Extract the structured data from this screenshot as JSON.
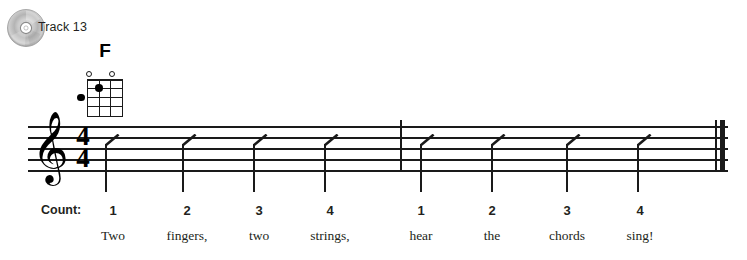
{
  "track": {
    "icon": "cd-disc-icon",
    "label": "Track 13"
  },
  "chord": {
    "name": "F",
    "strings": 4,
    "frets": 4,
    "open_strings": [
      1,
      4
    ],
    "dots": [
      {
        "string": 3,
        "fret": 1
      },
      {
        "string": 1,
        "fret": 2
      }
    ]
  },
  "staff": {
    "clef": "treble-clef",
    "clef_glyph": "𝄞",
    "time_signature": {
      "beats": "4",
      "beat_value": "4"
    },
    "measures": [
      {
        "index": 1,
        "marks": [
          "slash",
          "slash",
          "slash",
          "slash"
        ]
      },
      {
        "index": 2,
        "marks": [
          "slash",
          "slash",
          "slash",
          "slash"
        ]
      }
    ],
    "final_barline": "thin-thick"
  },
  "count_row": {
    "label": "Count:",
    "beats": [
      "1",
      "2",
      "3",
      "4",
      "1",
      "2",
      "3",
      "4"
    ]
  },
  "lyrics": [
    "Two",
    "fingers,",
    "two",
    "strings,",
    "hear",
    "the",
    "chords",
    "sing!"
  ],
  "colors": {
    "ink": "#1a1a1a",
    "text": "#231f20",
    "paper": "#ffffff",
    "disc_light": "#e3e3e3",
    "disc_dark": "#9b9b9b"
  }
}
